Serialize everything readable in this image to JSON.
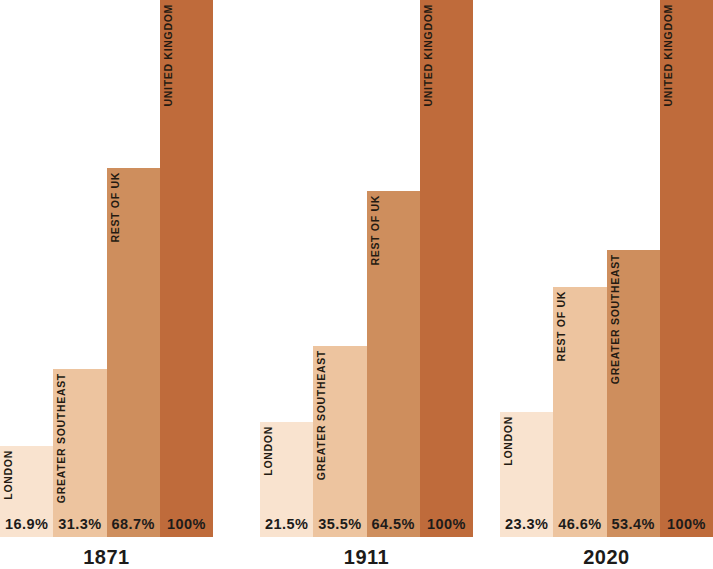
{
  "chart_data": {
    "type": "bar",
    "title": "",
    "subtitle": "",
    "xlabel": "",
    "ylabel": "",
    "ylim": [
      0,
      100
    ],
    "grid": false,
    "legend": "none",
    "value_suffix": "%",
    "note": "Three grouped bar panels, one per year. Each bar is labelled in rotated small caps inside the bar and its percentage is printed at the baseline. Bar heights are proportional to the percentage of a 100% full-height United Kingdom bar.",
    "palette": {
      "shade_1_lightest": "#F9E3CF",
      "shade_2_light": "#EDC49F",
      "shade_3_medium": "#CE8E5D",
      "shade_4_dark": "#BF6B3B",
      "text_dark": "#1C1B1A",
      "label_dark": "#241A12",
      "background": "#FFFFFF"
    },
    "groups": [
      {
        "year": "1871",
        "bars": [
          {
            "label": "LONDON",
            "value": 16.9,
            "value_text": "16.9%",
            "color": "#F9E3CF"
          },
          {
            "label": "GREATER SOUTHEAST",
            "value": 31.3,
            "value_text": "31.3%",
            "color": "#EDC49F"
          },
          {
            "label": "REST OF UK",
            "value": 68.7,
            "value_text": "68.7%",
            "color": "#CE8E5D"
          },
          {
            "label": "UNITED KINGDOM",
            "value": 100,
            "value_text": "100%",
            "color": "#BF6B3B"
          }
        ]
      },
      {
        "year": "1911",
        "bars": [
          {
            "label": "LONDON",
            "value": 21.5,
            "value_text": "21.5%",
            "color": "#F9E3CF"
          },
          {
            "label": "GREATER SOUTHEAST",
            "value": 35.5,
            "value_text": "35.5%",
            "color": "#EDC49F"
          },
          {
            "label": "REST OF UK",
            "value": 64.5,
            "value_text": "64.5%",
            "color": "#CE8E5D"
          },
          {
            "label": "UNITED KINGDOM",
            "value": 100,
            "value_text": "100%",
            "color": "#BF6B3B"
          }
        ]
      },
      {
        "year": "2020",
        "bars": [
          {
            "label": "LONDON",
            "value": 23.3,
            "value_text": "23.3%",
            "color": "#F9E3CF"
          },
          {
            "label": "REST OF UK",
            "value": 46.6,
            "value_text": "46.6%",
            "color": "#EDC49F"
          },
          {
            "label": "GREATER SOUTHEAST",
            "value": 53.4,
            "value_text": "53.4%",
            "color": "#CE8E5D"
          },
          {
            "label": "UNITED KINGDOM",
            "value": 100,
            "value_text": "100%",
            "color": "#BF6B3B"
          }
        ]
      }
    ]
  }
}
